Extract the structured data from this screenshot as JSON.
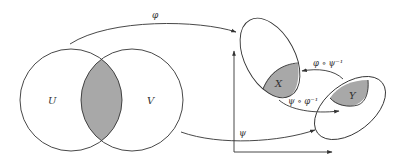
{
  "diagram": {
    "colors": {
      "stroke": "#333333",
      "shade": "#a8a8a8",
      "background": "#ffffff"
    },
    "sets": {
      "U": "U",
      "V": "V",
      "X": "X",
      "Y": "Y"
    },
    "maps": {
      "phi": "φ",
      "psi": "ψ",
      "phi_psi_inv": "φ ∘ ψ⁻¹",
      "psi_phi_inv": "ψ ∘ φ⁻¹"
    }
  }
}
